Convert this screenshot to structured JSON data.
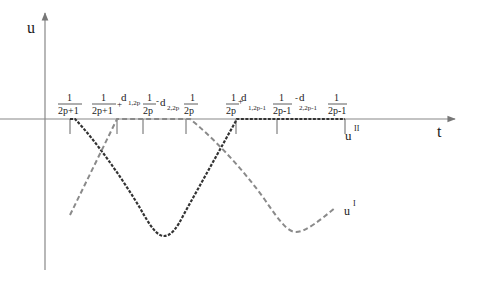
{
  "figure": {
    "axis_labels": {
      "y": "u",
      "x": "t"
    },
    "colors": {
      "axis": "#888888",
      "curve_u2": "#333333",
      "curve_u1": "#8a8a8a",
      "text": "#1a1a1a"
    },
    "ticks": [
      {
        "x": 70,
        "num": "1",
        "den": "2p+1"
      },
      {
        "x": 117,
        "num": "1",
        "den": "2p+1",
        "suffix": "+",
        "d": "d",
        "sub": "1,2p"
      },
      {
        "x": 143,
        "num": "1",
        "den": "2p",
        "suffix": "-",
        "d": "d",
        "sub": "2,2p"
      },
      {
        "x": 186,
        "num": "1",
        "den": "2p"
      },
      {
        "x": 236,
        "num": "1",
        "den": "2p",
        "suffix": "+",
        "d": "d",
        "sub": "1,2p-1"
      },
      {
        "x": 277,
        "num": "1",
        "den": "2p-1",
        "suffix": "-",
        "d": "d",
        "sub": "2,2p-1"
      },
      {
        "x": 345,
        "num": "1",
        "den": "2p-1"
      }
    ],
    "curve_labels": {
      "u2": {
        "base": "u",
        "sup": "II"
      },
      "u1": {
        "base": "u",
        "sup": "I"
      }
    }
  }
}
